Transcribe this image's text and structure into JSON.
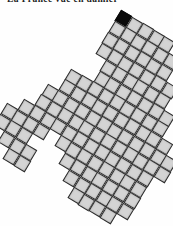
{
  "caption": {
    "text": "La France vue en damier",
    "clipped_at_top": true
  },
  "map": {
    "type": "grid-cartogram",
    "description": "Region drawn as a tiled grid of equal squares, rotated clockwise, with one highlighted square at the northern tip",
    "cell_fill": "#d4d4d4",
    "cell_border": "#2a2a2a",
    "highlight_fill": "#0a0a0a",
    "cell_size_px": 12.6,
    "rotation_deg": 31,
    "anchor": {
      "col": 4,
      "row": 0,
      "x": 123.5,
      "y": 18.5
    },
    "highlighted_cell": {
      "col": 4,
      "row": 0
    },
    "rows": [
      "....B####......",
      "....######.....",
      "....######.....",
      "....#######....",
      ".....######....",
      ".....#######...",
      "...#########...",
      "...##########..",
      "..############.",
      "..############.",
      ".############..",
      "####.########..",
      "###...#######..",
      ".###...######..",
      "..##....####..."
    ]
  }
}
